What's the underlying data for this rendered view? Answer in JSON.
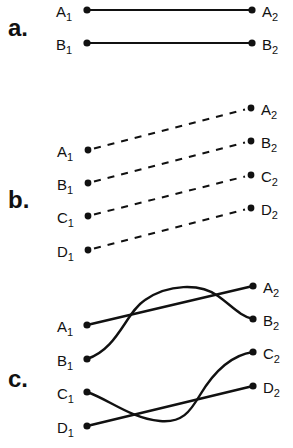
{
  "panels": [
    {
      "label": "a.",
      "label_pos": [
        8,
        36
      ],
      "line_style": "solid",
      "left": [
        {
          "name": "A",
          "sub": "1",
          "x": 87,
          "y": 10
        },
        {
          "name": "B",
          "sub": "1",
          "x": 87,
          "y": 43
        }
      ],
      "right": [
        {
          "name": "A",
          "sub": "2",
          "x": 252,
          "y": 10
        },
        {
          "name": "B",
          "sub": "2",
          "x": 252,
          "y": 43
        }
      ]
    },
    {
      "label": "b.",
      "label_pos": [
        8,
        208
      ],
      "line_style": "dashed",
      "left": [
        {
          "name": "A",
          "sub": "1",
          "x": 88,
          "y": 150
        },
        {
          "name": "B",
          "sub": "1",
          "x": 88,
          "y": 183
        },
        {
          "name": "C",
          "sub": "1",
          "x": 88,
          "y": 216
        },
        {
          "name": "D",
          "sub": "1",
          "x": 88,
          "y": 250
        }
      ],
      "right": [
        {
          "name": "A",
          "sub": "2",
          "x": 251,
          "y": 108
        },
        {
          "name": "B",
          "sub": "2",
          "x": 251,
          "y": 141
        },
        {
          "name": "C",
          "sub": "2",
          "x": 251,
          "y": 175
        },
        {
          "name": "D",
          "sub": "2",
          "x": 251,
          "y": 208
        }
      ]
    },
    {
      "label": "c.",
      "label_pos": [
        8,
        387
      ],
      "line_style": "solid-crossing",
      "left": [
        {
          "name": "A",
          "sub": "1",
          "x": 87,
          "y": 325
        },
        {
          "name": "B",
          "sub": "1",
          "x": 87,
          "y": 359
        },
        {
          "name": "C",
          "sub": "1",
          "x": 87,
          "y": 392
        },
        {
          "name": "D",
          "sub": "1",
          "x": 87,
          "y": 426
        }
      ],
      "right": [
        {
          "name": "A",
          "sub": "2",
          "x": 253,
          "y": 286
        },
        {
          "name": "B",
          "sub": "2",
          "x": 253,
          "y": 319
        },
        {
          "name": "C",
          "sub": "2",
          "x": 253,
          "y": 352
        },
        {
          "name": "D",
          "sub": "2",
          "x": 253,
          "y": 386
        }
      ]
    }
  ],
  "colors": {
    "ink": "#111111",
    "background": "#ffffff"
  }
}
